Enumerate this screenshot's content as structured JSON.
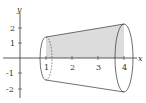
{
  "figure": {
    "x_axis_label": "x",
    "y_axis_label": "y",
    "x_ticks": [
      "1",
      "2",
      "3",
      "4"
    ],
    "y_ticks": [
      "2",
      "1",
      "-1",
      "-2"
    ],
    "x_range": [
      0,
      4
    ],
    "left_radius": 1.4,
    "right_radius": 2.2,
    "shade_color": "#d9d9d9",
    "line_color": "#333333"
  }
}
